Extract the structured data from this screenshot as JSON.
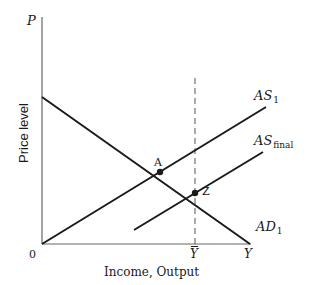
{
  "diagram": {
    "type": "aggregate-supply-demand",
    "axes": {
      "y_axis_symbol": "P",
      "y_axis_label": "Price level",
      "x_axis_symbol": "Y",
      "x_axis_label": "Income, Output",
      "origin_label": "0"
    },
    "curves": {
      "as1": {
        "base": "AS",
        "sub": "1"
      },
      "as_final": {
        "base": "AS",
        "sub": "final"
      },
      "ad1": {
        "base": "AD",
        "sub": "1"
      }
    },
    "points": {
      "a": "A",
      "z": "Z"
    },
    "reference": {
      "potential_output_label": "Y"
    },
    "colors": {
      "line": "#1a1a1a",
      "axis": "#666666",
      "dashed": "#555555",
      "background": "#ffffff"
    }
  }
}
